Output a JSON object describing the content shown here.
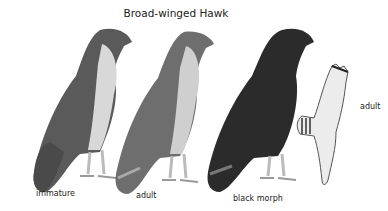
{
  "title": "Broad-winged Hawk",
  "figures": [
    {
      "id": "immature",
      "label": "immature",
      "shade": "#5a5a5a",
      "breast": "#d8d8d8"
    },
    {
      "id": "adult-perched",
      "label": "adult",
      "shade": "#6e6e6e",
      "breast": "#cfcfcf"
    },
    {
      "id": "black-morph",
      "label": "black morph",
      "shade": "#2b2b2b",
      "breast": "#333333"
    },
    {
      "id": "adult-flight",
      "label": "adult",
      "shade": "#dcdcdc",
      "breast": "#f0f0f0"
    }
  ]
}
